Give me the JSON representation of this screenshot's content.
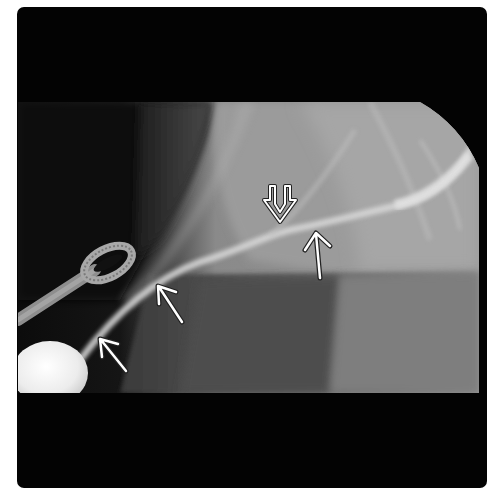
{
  "image": {
    "type": "fluoroscopic radiograph",
    "background_color": "#ffffff",
    "frame_color": "#030303",
    "field_colors": {
      "dark_soft_tissue": "#2a2a2a",
      "mid_grey": "#7c7c7c",
      "light_grey": "#a9a9a9",
      "contrast_duct": "#d8d8d8",
      "bright_object": "#f2f2f2"
    }
  },
  "annotations": {
    "arrow_color": "#ffffff",
    "arrow_outline_color": "#222222",
    "open_arrowhead": {
      "label": "open-arrowhead-down",
      "tip": [
        280,
        222
      ]
    },
    "arrows": [
      {
        "label": "arrow-duct-right",
        "tip": [
          316,
          233
        ],
        "tail": [
          320,
          278
        ]
      },
      {
        "label": "arrow-duct-middle",
        "tip": [
          158,
          286
        ],
        "tail": [
          182,
          322
        ]
      },
      {
        "label": "arrow-duct-lower",
        "tip": [
          100,
          339
        ],
        "tail": [
          126,
          371
        ]
      }
    ]
  },
  "objects": [
    {
      "label": "surgical-loop-instrument"
    },
    {
      "label": "round-radiopaque-object"
    }
  ]
}
